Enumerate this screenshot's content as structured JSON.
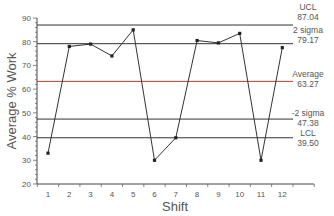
{
  "chart_data": {
    "type": "line",
    "title": "",
    "xlabel": "Shift",
    "ylabel": "Average % Work",
    "ylim": [
      20,
      90
    ],
    "yticks": [
      20,
      30,
      40,
      50,
      60,
      70,
      80,
      90
    ],
    "categories": [
      "1",
      "2",
      "3",
      "4",
      "5",
      "6",
      "7",
      "8",
      "9",
      "10",
      "11",
      "12"
    ],
    "series": [
      {
        "name": "Average % Work",
        "values": [
          33,
          78,
          79,
          74,
          85,
          30,
          39.5,
          80.5,
          79.5,
          83.5,
          30,
          77.5
        ],
        "color": "#333333"
      }
    ],
    "reference_lines": [
      {
        "label": "UCL",
        "value": 87.04,
        "value_text": "87.04",
        "color": "#333333"
      },
      {
        "label": "2 sigma",
        "value": 79.17,
        "value_text": "79.17",
        "color": "#333333"
      },
      {
        "label": "Average",
        "value": 63.27,
        "value_text": "63.27",
        "color": "#c0392b"
      },
      {
        "label": "-2 sigma",
        "value": 47.38,
        "value_text": "47.38",
        "color": "#333333"
      },
      {
        "label": "LCL",
        "value": 39.5,
        "value_text": "39.50",
        "color": "#333333"
      }
    ],
    "grid": false,
    "legend": "none"
  }
}
